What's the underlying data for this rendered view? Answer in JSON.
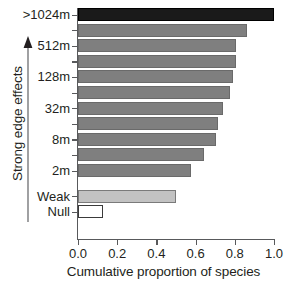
{
  "chart_data": {
    "type": "bar",
    "orientation": "horizontal",
    "title": "",
    "xlabel": "Cumulative proportion of species",
    "ylabel": "Strong edge effects",
    "xlim": [
      0.0,
      1.0
    ],
    "xticks": [
      "0.0",
      "0.2",
      "0.4",
      "0.6",
      "0.8",
      "1.0"
    ],
    "xtick_values": [
      0.0,
      0.2,
      0.4,
      0.6,
      0.8,
      1.0
    ],
    "grid": false,
    "legend": false,
    "categories": [
      ">1024m",
      "",
      "512m",
      "",
      "128m",
      "",
      "32m",
      "",
      "8m",
      "",
      "2m",
      "Weak",
      "Null"
    ],
    "values": [
      1.0,
      0.86,
      0.805,
      0.805,
      0.79,
      0.775,
      0.74,
      0.715,
      0.705,
      0.645,
      0.575,
      0.5,
      0.125
    ],
    "bars": [
      {
        "label": ">1024m",
        "value": 1.0,
        "style": "solid-dark"
      },
      {
        "label": "",
        "value": 0.86,
        "style": "solid-gray"
      },
      {
        "label": "512m",
        "value": 0.805,
        "style": "solid-gray"
      },
      {
        "label": "",
        "value": 0.805,
        "style": "solid-gray"
      },
      {
        "label": "128m",
        "value": 0.79,
        "style": "solid-gray"
      },
      {
        "label": "",
        "value": 0.775,
        "style": "solid-gray"
      },
      {
        "label": "32m",
        "value": 0.74,
        "style": "solid-gray"
      },
      {
        "label": "",
        "value": 0.715,
        "style": "solid-gray"
      },
      {
        "label": "8m",
        "value": 0.705,
        "style": "solid-gray"
      },
      {
        "label": "",
        "value": 0.645,
        "style": "solid-gray"
      },
      {
        "label": "2m",
        "value": 0.575,
        "style": "solid-gray"
      },
      {
        "label": "Weak",
        "value": 0.5,
        "style": "solid-light"
      },
      {
        "label": "Null",
        "value": 0.125,
        "style": "hollow"
      }
    ],
    "colors": {
      "bar_dark": "#1a1a1a",
      "bar_gray": "#7f7f7f",
      "bar_light": "#c2c2c2",
      "bar_hollow_fill": "#ffffff",
      "axis": "#58595b",
      "text": "#231f20",
      "background": "#ffffff"
    },
    "annotations": [
      {
        "name": "strong-edge-effects-arrow",
        "text": "Strong edge effects",
        "direction": "up"
      }
    ]
  }
}
